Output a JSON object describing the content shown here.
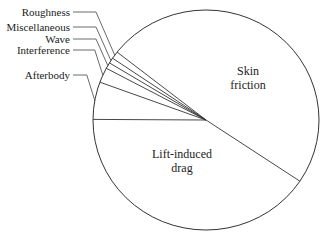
{
  "chart_data": {
    "type": "pie",
    "title": "",
    "start_angle_deg": -33.8,
    "direction": "counterclockwise",
    "slices": [
      {
        "name": "Skin friction",
        "label_lines": [
          "Skin",
          "friction"
        ],
        "value": 48.8,
        "label_placement": "inside"
      },
      {
        "name": "Roughness",
        "label_lines": [
          "Roughness"
        ],
        "value": 1.1,
        "label_placement": "outside-left"
      },
      {
        "name": "Miscellaneous",
        "label_lines": [
          "Miscellaneous"
        ],
        "value": 0.8,
        "label_placement": "outside-left"
      },
      {
        "name": "Wave",
        "label_lines": [
          "Wave"
        ],
        "value": 0.9,
        "label_placement": "outside-left"
      },
      {
        "name": "Interference",
        "label_lines": [
          "Interference"
        ],
        "value": 2.2,
        "label_placement": "outside-left"
      },
      {
        "name": "Afterbody",
        "label_lines": [
          "Afterbody"
        ],
        "value": 5.5,
        "label_placement": "outside-left"
      },
      {
        "name": "Lift-induced drag",
        "label_lines": [
          "Lift-induced",
          "drag"
        ],
        "value": 40.7,
        "label_placement": "inside"
      }
    ],
    "units": "percent of total drag (estimated)",
    "colors": {
      "stroke": "#333333",
      "fill": "#ffffff",
      "leader": "#444444"
    }
  }
}
